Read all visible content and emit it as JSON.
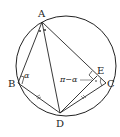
{
  "diagram": {
    "type": "geometry-circle-inscribed-quadrilateral",
    "points": {
      "A": {
        "label": "A",
        "x": 42,
        "y": 22
      },
      "B": {
        "label": "B",
        "x": 18,
        "y": 83
      },
      "C": {
        "label": "C",
        "x": 106,
        "y": 83
      },
      "D": {
        "label": "D",
        "x": 60,
        "y": 113
      },
      "E": {
        "label": "E",
        "x": 97,
        "y": 76
      }
    },
    "circle": {
      "cx": 66,
      "cy": 66,
      "r": 50
    },
    "angle_labels": {
      "alpha": "α",
      "pi_minus_alpha": "π−α"
    },
    "colors": {
      "stroke": "#222222",
      "background": "#ffffff"
    }
  }
}
